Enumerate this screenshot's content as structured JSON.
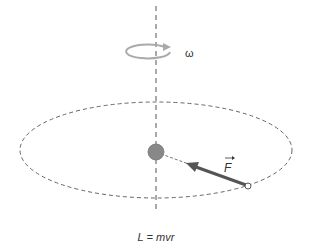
{
  "diagram": {
    "omega_label": "ω",
    "force_label": "F",
    "equation": "L = mvr",
    "colors": {
      "axis": "#555555",
      "orbit": "#666666",
      "rotation_arrow": "#aaaaaa",
      "central_mass": "#888888",
      "force_arrow": "#555555",
      "particle": "#555555"
    }
  }
}
